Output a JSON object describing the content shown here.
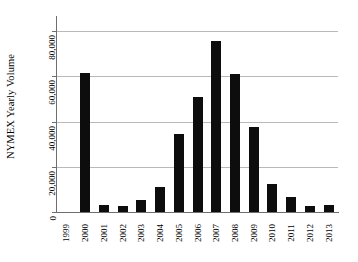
{
  "chart_data": {
    "type": "bar",
    "title": "",
    "subtitle": "",
    "xlabel": "",
    "ylabel": "NYMEX Yearly Volume",
    "categories": [
      "1999",
      "2000",
      "2001",
      "2002",
      "2003",
      "2004",
      "2005",
      "2006",
      "2007",
      "2008",
      "2009",
      "2010",
      "2011",
      "2012",
      "2013"
    ],
    "values": [
      0,
      61500,
      3000,
      2800,
      5500,
      11000,
      34500,
      51000,
      75500,
      61000,
      37500,
      12500,
      6500,
      2700,
      3000
    ],
    "ylim": [
      0,
      84000
    ],
    "yticks": [
      0,
      20000,
      40000,
      60000,
      80000
    ],
    "ytick_labels": [
      "0",
      "20,000",
      "40,000",
      "60,000",
      "80,000"
    ],
    "grid": "horizontal",
    "legend": "none",
    "bar_color": "#0d0d0d",
    "grid_color": "#b9b9b9",
    "axis_color": "#6e6e6e",
    "background_color": "#ffffff",
    "series": [
      {
        "name": "NYMEX Yearly Volume",
        "values": [
          0,
          61500,
          3000,
          2800,
          5500,
          11000,
          34500,
          51000,
          75500,
          61000,
          37500,
          12500,
          6500,
          2700,
          3000
        ]
      }
    ]
  }
}
